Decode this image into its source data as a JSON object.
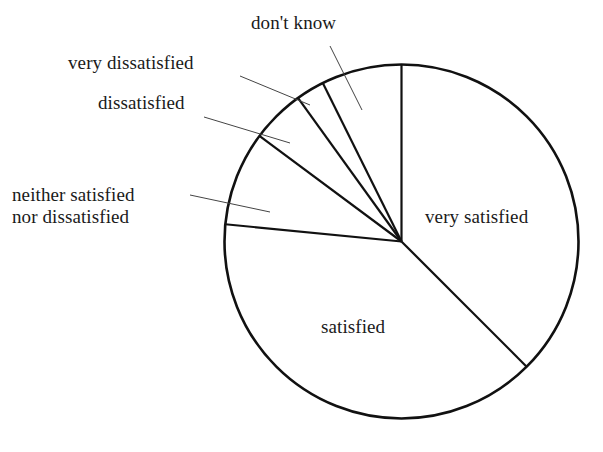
{
  "chart_data": {
    "type": "pie",
    "title": "",
    "subtitle": "",
    "xlabel": "",
    "ylabel": "",
    "legend_position": "none",
    "grid": false,
    "labels_placement": "slice-labels-with-leader-lines",
    "start_angle_deg": 0,
    "direction": "clockwise",
    "categories": [
      "very satisfied",
      "satisfied",
      "neither satisfied nor dissatisfied",
      "dissatisfied",
      "very dissatisfied",
      "don't know"
    ],
    "values": [
      37.5,
      39.0,
      8.6,
      4.9,
      2.6,
      7.4
    ],
    "slices": [
      {
        "label": "very satisfied",
        "value": 37.5,
        "start_angle_deg": 0.0,
        "end_angle_deg": 135.0,
        "label_placement": "inside"
      },
      {
        "label": "satisfied",
        "value": 39.0,
        "start_angle_deg": 135.0,
        "end_angle_deg": 275.6,
        "label_placement": "inside"
      },
      {
        "label": "neither satisfied nor dissatisfied",
        "value": 8.6,
        "start_angle_deg": 275.6,
        "end_angle_deg": 306.6,
        "label_placement": "outside-leader"
      },
      {
        "label": "dissatisfied",
        "value": 4.9,
        "start_angle_deg": 306.6,
        "end_angle_deg": 324.2,
        "label_placement": "outside-leader"
      },
      {
        "label": "very dissatisfied",
        "value": 2.6,
        "start_angle_deg": 324.2,
        "end_angle_deg": 333.6,
        "label_placement": "outside-leader"
      },
      {
        "label": "don't know",
        "value": 7.4,
        "start_angle_deg": 333.6,
        "end_angle_deg": 360.0,
        "label_placement": "outside-leader"
      }
    ]
  },
  "labels": {
    "dont_know": "don't know",
    "very_dissatisfied": "very dissatisfied",
    "dissatisfied": "dissatisfied",
    "neither_line1": "neither satisfied",
    "neither_line2": "nor dissatisfied",
    "very_satisfied": "very satisfied",
    "satisfied": "satisfied"
  },
  "colors": {
    "background": "#ffffff",
    "outline": "#111111",
    "divider": "#111111",
    "leader": "#444444",
    "text": "#1a1a1a"
  }
}
